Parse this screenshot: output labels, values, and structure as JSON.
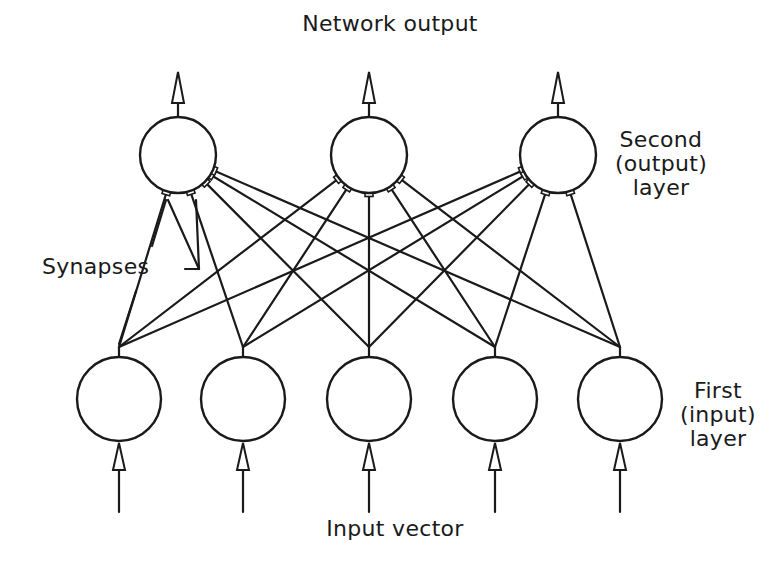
{
  "diagram": {
    "type": "neural-network",
    "title": "Network output",
    "bottom_label": "Input vector",
    "synapses_label": "Synapses",
    "output_layer_label": [
      "Second",
      "(output)",
      "layer"
    ],
    "input_layer_label": [
      "First",
      "(input)",
      "layer"
    ],
    "stroke_color": "#1a1a1a",
    "background": "#ffffff",
    "output_layer": {
      "neuron_count": 3,
      "centers": [
        [
          178,
          155
        ],
        [
          369,
          155
        ],
        [
          558,
          155
        ]
      ],
      "radius": 38
    },
    "input_layer": {
      "neuron_count": 5,
      "centers": [
        [
          119,
          399
        ],
        [
          243,
          399
        ],
        [
          369,
          399
        ],
        [
          495,
          399
        ],
        [
          620,
          399
        ]
      ],
      "radius": 42,
      "branch_y": 347
    },
    "connections": "fully-connected (5 inputs x 3 outputs = 15 synapses)"
  }
}
